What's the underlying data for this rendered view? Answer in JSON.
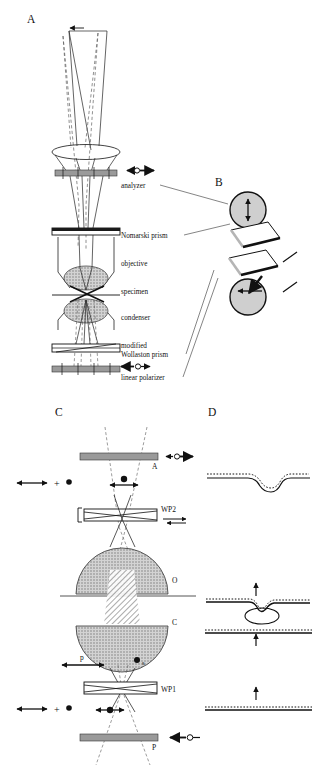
{
  "figure": {
    "title_visible": false,
    "panels": [
      {
        "id": "A",
        "label": "A"
      },
      {
        "id": "B",
        "label": "B"
      },
      {
        "id": "C",
        "label": "C"
      },
      {
        "id": "D",
        "label": "D"
      }
    ]
  },
  "panelA": {
    "label": "A",
    "components": [
      {
        "key": "analyzer",
        "label": "analyzer"
      },
      {
        "key": "nomarski_prism",
        "label": "Nomarski prism"
      },
      {
        "key": "objective",
        "label": "objective"
      },
      {
        "key": "specimen",
        "label": "specimen"
      },
      {
        "key": "condenser",
        "label": "condenser"
      },
      {
        "key": "modified_wollaston_prism_line1",
        "label": "modified"
      },
      {
        "key": "modified_wollaston_prism_line2",
        "label": "Wollaston prism"
      },
      {
        "key": "linear_polarizer",
        "label": "linear polarizer"
      }
    ],
    "symbols": [
      {
        "key": "analyzer-polarization",
        "type": "double-arrow-with-circle",
        "orientation": "horizontal"
      },
      {
        "key": "polarizer-polarization",
        "type": "double-arrow-with-circle",
        "orientation": "horizontal"
      }
    ]
  },
  "panelB": {
    "label": "B",
    "elements": [
      {
        "key": "upper-polarizer-disc",
        "arrow": "vertical-double-arrow",
        "fill": "#cfcfcf"
      },
      {
        "key": "upper-prism-slab",
        "fill": "#ffffff"
      },
      {
        "key": "lower-prism-slab",
        "fill": "#ffffff"
      },
      {
        "key": "lower-polarizer-disc",
        "arrow": "horizontal-left-arrow",
        "fill": "#cfcfcf"
      }
    ]
  },
  "panelC": {
    "label": "C",
    "components": [
      {
        "key": "analyzer",
        "label": "A"
      },
      {
        "key": "wollaston-prism-2",
        "label": "WP2"
      },
      {
        "key": "objective",
        "label": "O"
      },
      {
        "key": "condenser",
        "label": "C"
      },
      {
        "key": "wollaston-prism-1",
        "label": "WP1"
      },
      {
        "key": "polarizer",
        "label": "P"
      }
    ],
    "ray_labels": [
      {
        "key": "p-ray",
        "label": "p"
      },
      {
        "key": "s-ray",
        "label": "s"
      }
    ],
    "polarization_states": [
      {
        "key": "state-top",
        "symbols": [
          "double-arrow",
          "plus",
          "dot"
        ]
      },
      {
        "key": "state-bottom",
        "symbols": [
          "double-arrow",
          "plus",
          "dot"
        ]
      }
    ]
  },
  "panelD": {
    "label": "D",
    "wavefronts": [
      {
        "key": "wavefront-top",
        "shape": "single-dip",
        "arrow": false
      },
      {
        "key": "wavefront-middle",
        "shape": "sheared-pair-with-specimen",
        "arrow": true
      },
      {
        "key": "wavefront-bottom",
        "shape": "flat",
        "arrow": true
      }
    ]
  },
  "colors": {
    "bar_gray": "#9a9a9a",
    "disc_gray": "#cfcfcf",
    "lens_hatch": "#8d8d8d",
    "ink": "#111111",
    "dashed_ray": "#555555",
    "background": "#ffffff"
  }
}
